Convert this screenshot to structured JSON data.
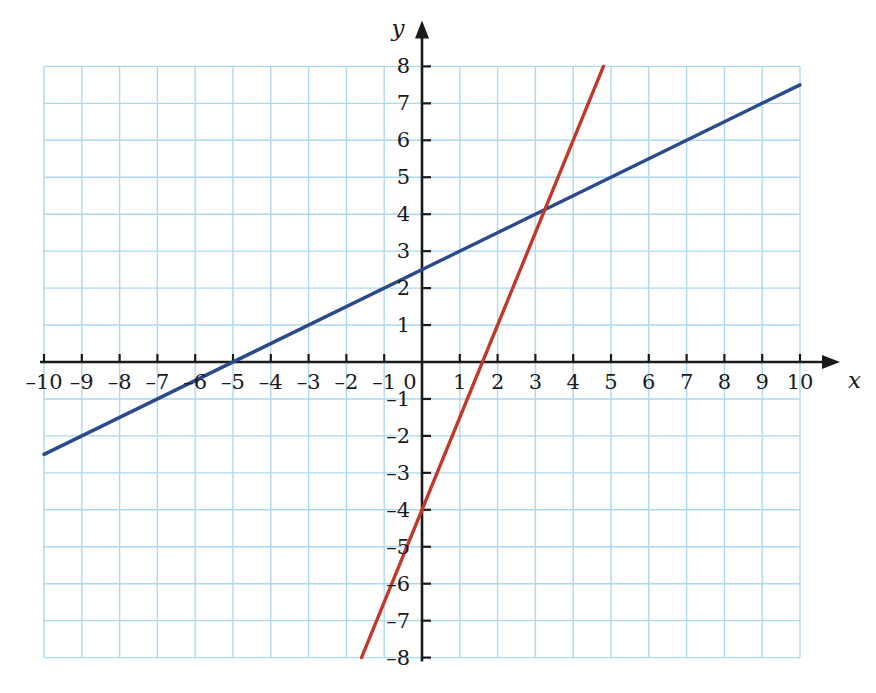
{
  "figure": {
    "kind": "coordinate-plane",
    "background_color": "#ffffff",
    "width": 876,
    "height": 693
  },
  "axes": {
    "x_axis_label": "x",
    "y_axis_label": "y",
    "origin_label": "0",
    "axis_color": "#1a1a1a",
    "grid_color": "#aed8f0",
    "x_ticks": [
      "–10",
      "–9",
      "–8",
      "–7",
      "–6",
      "–5",
      "–4",
      "–3",
      "–2",
      "–1",
      "1",
      "2",
      "3",
      "4",
      "5",
      "6",
      "7",
      "8",
      "9",
      "10"
    ],
    "y_ticks": [
      "8",
      "7",
      "6",
      "5",
      "4",
      "3",
      "2",
      "1",
      "–1",
      "–2",
      "–3",
      "–4",
      "–5",
      "–6",
      "–7",
      "–8"
    ]
  },
  "chart_data": {
    "type": "line",
    "title": "",
    "xlabel": "x",
    "ylabel": "y",
    "xlim": [
      -10,
      10
    ],
    "ylim": [
      -8,
      8
    ],
    "xticks": [
      -10,
      -9,
      -8,
      -7,
      -6,
      -5,
      -4,
      -3,
      -2,
      -1,
      0,
      1,
      2,
      3,
      4,
      5,
      6,
      7,
      8,
      9,
      10
    ],
    "yticks": [
      -8,
      -7,
      -6,
      -5,
      -4,
      -3,
      -2,
      -1,
      0,
      1,
      2,
      3,
      4,
      5,
      6,
      7,
      8
    ],
    "grid": true,
    "legend": "none",
    "series": [
      {
        "name": "blue-line",
        "color": "#2b4a8b",
        "equation": "y = 0.5x + 2.5",
        "slope": 0.5,
        "y_intercept": 2.5,
        "x_intercept": -5,
        "x": [
          -10,
          10
        ],
        "values": [
          -2.5,
          7.5
        ]
      },
      {
        "name": "red-line",
        "color": "#c0392b",
        "equation": "y = 2.5x - 4",
        "slope": 2.5,
        "y_intercept": -4,
        "x_intercept": 1.6,
        "x": [
          -1.6,
          4.8
        ],
        "values": [
          -8,
          8
        ]
      }
    ],
    "annotations": [
      {
        "name": "intersection",
        "x": 3.25,
        "y": 4.125,
        "label": ""
      }
    ]
  }
}
